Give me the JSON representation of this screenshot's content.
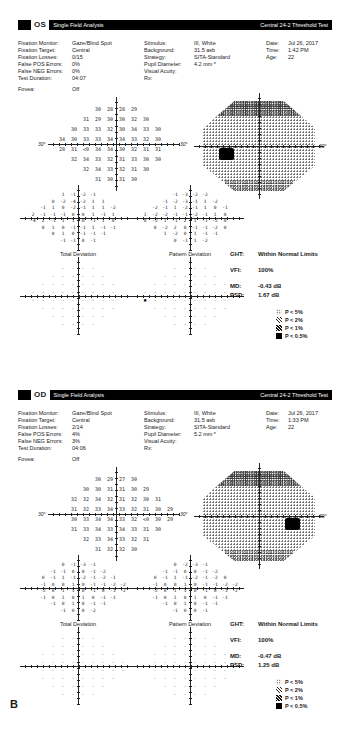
{
  "figure_label": "B",
  "legend": [
    {
      "symbol": "p5-dots",
      "label": "P < 5%"
    },
    {
      "symbol": "p2-hatch",
      "label": "P < 2%"
    },
    {
      "symbol": "p1-hatch",
      "label": "P < 1%"
    },
    {
      "symbol": "p05-solid",
      "label": "P < 0.5%"
    }
  ],
  "panels": [
    {
      "eye": "OS",
      "analysis": "Single Field Analysis",
      "test": "Central 24-2 Threshold Test",
      "params_left": [
        [
          "Fixation Monitor:",
          "Gaze/Blind Spot"
        ],
        [
          "Fixation Target:",
          "Central"
        ],
        [
          "Fixation Losses:",
          "0/15"
        ],
        [
          "False POS Errors:",
          "0%"
        ],
        [
          "False NEG Errors:",
          "0%"
        ],
        [
          "Test Duration:",
          "04:07"
        ],
        [
          "Fovea:",
          "Off"
        ]
      ],
      "params_mid": [
        [
          "Stimulus:",
          "III, White"
        ],
        [
          "Background:",
          "31.5 asb"
        ],
        [
          "Strategy:",
          "SITA-Standard"
        ],
        [
          "Pupil Diameter:",
          "4.2 mm *"
        ],
        [
          "Visual Acuity:",
          ""
        ],
        [
          "Rx:",
          ""
        ]
      ],
      "params_right": [
        [
          "Date:",
          "Jul 26, 2017"
        ],
        [
          "Time:",
          "1:42 PM"
        ],
        [
          "Age:",
          "22"
        ]
      ],
      "deg": "30°",
      "threshold_rows": [
        "_ _ _ 30 28 28 29 _ _ _",
        "_ _ 31 29 30 30 32 30 _ _",
        "_ 30 33 33 32 30 34 33 30 _",
        "34 30 33 33 34 34 33 32 30 _",
        "28 31 <0 34 34 30 32 31 31 _",
        "_ 32 34 33 32 31 33 30 30 _",
        "_ _ 32 34 33 32 31 30 _ _",
        "_ _ _ 31 30 31 30 _ _ _"
      ],
      "total_dev_rows": [
        "_ _ _ 1 -1 -2 -1 _ _ _",
        "_ _ 0 -2 -4 -2 1 1 _ _",
        "_ -1 1 0 -2 -1 1 1 -2 _",
        "2 -1 -1 -1 0 0 1 -1 1 _",
        "-4 2 -1 1 1 0 -1 1 0 _",
        "_ 0 1 0 -1 -1 1 -1 -1 _",
        "_ _ 0 1 0 -1 -1 -1 _ _",
        "_ _ _ -1 -1 0 -1 _ _ _"
      ],
      "pattern_dev_rows": [
        "_ _ _ -1 -3 -2 -2 _ _ _",
        "_ _ -1 -2 -3 -1 1 -2 _ _",
        "_ -2 -1 1 -2 -1 1 0 -1 _",
        "1 -2 -2 -1 -1 -2 -1 1 0 _",
        "0 -2 1 -1 2 1 -1 -2 0 _",
        "_ 0 -2 2 0 -1 -1 -2 0 _",
        "_ _ 1 -2 0 1 -1 -1 _ _",
        "_ _ _ 0 -1 1 -2 _ _ _"
      ],
      "total_prob_rows": [
        "_ _ _ · · · · _ _ _",
        "_ _ · · · · · · _ _",
        "_ · · · · · · · · _",
        "· · · · · · · · · _",
        "· · · · · · · · · _",
        "_ · · · · · · · · _",
        "_ _ · · · · · · _ _",
        "_ _ _ · · · · _ _ _"
      ],
      "pattern_prob_rows": [
        "_ _ _ · · · · _ _ _",
        "_ _ · · · · · · _ _",
        "_ · · · · · · · · _",
        "· · · · · · · · · _",
        "▪ · · · · · · · · _",
        "_ · · · · · · · · _",
        "_ _ · · · · · · _ _",
        "_ _ _ · · · · _ _ _"
      ],
      "total_dev_label": "Total Deviation",
      "pattern_dev_label": "Pattern Deviation",
      "stats": [
        [
          "GHT:",
          "Within Normal Limits"
        ],
        [
          "VFI:",
          "100%"
        ],
        [
          "MD:",
          "-0.43 dB"
        ],
        [
          "PSD:",
          "1.67 dB"
        ]
      ]
    },
    {
      "eye": "OD",
      "analysis": "Single Field Analysis",
      "test": "Central 24-2 Threshold Test",
      "params_left": [
        [
          "Fixation Monitor:",
          "Gaze/Blind Spot"
        ],
        [
          "Fixation Target:",
          "Central"
        ],
        [
          "Fixation Losses:",
          "2/14"
        ],
        [
          "False POS Errors:",
          "4%"
        ],
        [
          "False NEG Errors:",
          "3%"
        ],
        [
          "Test Duration:",
          "04:06"
        ],
        [
          "Fovea:",
          "Off"
        ]
      ],
      "params_mid": [
        [
          "Stimulus:",
          "III, White"
        ],
        [
          "Background:",
          "31.5 asb"
        ],
        [
          "Strategy:",
          "SITA-Standard"
        ],
        [
          "Pupil Diameter:",
          "5.2 mm *"
        ],
        [
          "Visual Acuity:",
          ""
        ],
        [
          "Rx:",
          ""
        ]
      ],
      "params_right": [
        [
          "Date:",
          "Jul 26, 2017"
        ],
        [
          "Time:",
          "1:33 PM"
        ],
        [
          "Age:",
          "22"
        ]
      ],
      "deg": "30°",
      "threshold_rows": [
        "_ _ _ 30 29 27 30 _ _ _",
        "_ _ 30 30 31 31 30 29 _ _",
        "_ 32 32 34 32 31 32 30 31 _",
        "_ 31 32 33 34 33 32 31 30 29",
        "_ 30 33 34 34 33 32 <0 30 29",
        "_ 31 33 34 33 34 33 31 30 _",
        "_ _ 32 33 34 33 32 31 _ _",
        "_ _ _ 31 32 32 30 _ _ _"
      ],
      "total_dev_rows": [
        "_ _ _ 0 -1 -3 -1 _ _ _",
        "_ _ -1 -1 0 0 -1 -2 _ _",
        "_ 0 -1 1 -1 -2 -1 -2 -1 _",
        "_ -1 0 0 1 0 -1 -1 -2 -2",
        "_ -2 0 1 1 0 -1 0 -1 -2",
        "_ -1 0 1 0 1 0 -1 -1 _",
        "_ _ -1 0 1 0 -1 -1 _ _",
        "_ _ _ -1 0 0 -2 _ _ _"
      ],
      "pattern_dev_rows": [
        "_ _ _ 0 -2 -3 -1 _ _ _",
        "_ _ -1 -1 0 0 -1 -2 _ _",
        "_ 0 -1 1 -1 -2 -1 -2 0 _",
        "_ -1 0 0 1 0 -1 -1 -2 -2",
        "_ -2 0 1 1 0 -1 0 -1 -2",
        "_ -1 0 1 0 1 0 -1 -1 _",
        "_ _ -1 0 1 0 -1 -1 _ _",
        "_ _ _ -1 0 0 -1 _ _ _"
      ],
      "total_prob_rows": [
        "_ _ _ · · · · _ _ _",
        "_ _ · · · · · · _ _",
        "_ · · · · · · · · _",
        "_ · · · · · · · · ·",
        "_ · · · · · · · · ·",
        "_ · · · · · · · · _",
        "_ _ · · · · · · _ _",
        "_ _ _ · · · · _ _ _"
      ],
      "pattern_prob_rows": [
        "_ _ _ · · · · _ _ _",
        "_ _ · · · · · · _ _",
        "_ · · · · · · · · _",
        "_ · · · · · · · · ·",
        "_ · · · · · · · · ·",
        "_ · · · · · · · · _",
        "_ _ · · · · · · _ _",
        "_ _ _ · · · · _ _ _"
      ],
      "total_dev_label": "Total Deviation",
      "pattern_dev_label": "Pattern Deviation",
      "stats": [
        [
          "GHT:",
          "Within Normal Limits"
        ],
        [
          "VFI:",
          "100%"
        ],
        [
          "MD:",
          "-0.47 dB"
        ],
        [
          "PSD:",
          "1.25 dB"
        ]
      ]
    }
  ]
}
